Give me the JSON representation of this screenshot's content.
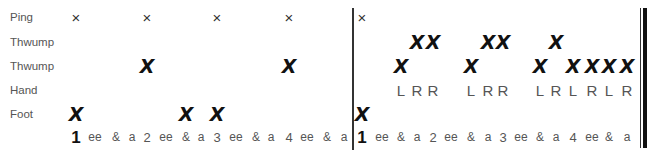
{
  "rows": [
    {
      "id": "ping",
      "label": "Ping",
      "y": 17
    },
    {
      "id": "thwump-high",
      "label": "Thwump",
      "y": 42
    },
    {
      "id": "thwump-low",
      "label": "Thwump",
      "y": 66
    },
    {
      "id": "hand",
      "label": "Hand",
      "y": 90
    },
    {
      "id": "foot",
      "label": "Foot",
      "y": 114
    },
    {
      "id": "count",
      "label": "",
      "y": 137
    }
  ],
  "counts": [
    "1",
    "ee",
    "&",
    "a",
    "2",
    "ee",
    "&",
    "a",
    "3",
    "ee",
    "&",
    "a",
    "4",
    "ee",
    "&",
    "a",
    "1",
    "ee",
    "&",
    "a",
    "2",
    "ee",
    "&",
    "a",
    "3",
    "ee",
    "&",
    "a",
    "4",
    "ee",
    "&",
    "a"
  ],
  "column_x": [
    76,
    95,
    116,
    132,
    147,
    166,
    186,
    201,
    217,
    236,
    256,
    271,
    289,
    307,
    327,
    344,
    362,
    382,
    401,
    417,
    433,
    451,
    471,
    488,
    503,
    521,
    540,
    556,
    573,
    592,
    609,
    627
  ],
  "notation": {
    "ping": {
      "glyph": "×",
      "columns": [
        0,
        4,
        8,
        12,
        16
      ]
    },
    "thwump-high": {
      "glyph": "X",
      "columns": [
        19,
        20,
        23,
        24,
        27
      ]
    },
    "thwump-low": {
      "glyph": "X",
      "columns": [
        4,
        12,
        18,
        22,
        26,
        28,
        29,
        30,
        31
      ]
    },
    "hand": {
      "sticking": {
        "18": "L",
        "19": "R",
        "20": "R",
        "22": "L",
        "23": "R",
        "24": "R",
        "26": "L",
        "27": "R",
        "28": "L",
        "29": "R",
        "30": "L",
        "31": "R"
      }
    },
    "foot": {
      "glyph": "X",
      "columns": [
        0,
        6,
        8,
        16
      ]
    }
  },
  "barlines": {
    "middle_x": 353,
    "final_thin_x": 641,
    "final_thick_x": 645
  }
}
